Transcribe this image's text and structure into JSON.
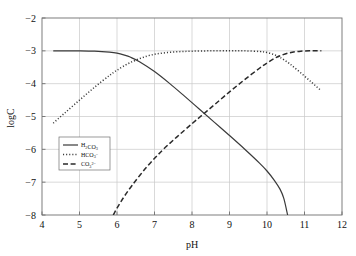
{
  "chart_data": {
    "type": "line",
    "title": "",
    "xlabel": "pH",
    "ylabel": "logC",
    "xlim": [
      4,
      12
    ],
    "ylim": [
      -8,
      -2
    ],
    "grid": true,
    "legend_position": "center-left",
    "xticks": [
      "4",
      "5",
      "6",
      "7",
      "8",
      "9",
      "10",
      "11",
      "12"
    ],
    "xtick_values": [
      4,
      5,
      6,
      7,
      8,
      9,
      10,
      11,
      12
    ],
    "yticks": [
      "−2",
      "−3",
      "−4",
      "−5",
      "−6",
      "−7",
      "−8"
    ],
    "ytick_values": [
      -2,
      -3,
      -4,
      -5,
      -6,
      -7,
      -8
    ],
    "series": [
      {
        "name": "H2CO3",
        "label_main": "H",
        "label_sub1": "2",
        "label_main2": "CO",
        "label_sub2": "3",
        "style": "solid",
        "color": "#3a3a3a",
        "x": [
          4.3,
          4.6,
          5.0,
          5.4,
          5.8,
          6.0,
          6.2,
          6.35,
          6.6,
          7.0,
          7.4,
          7.8,
          8.2,
          8.6,
          9.0,
          9.4,
          9.8,
          10.0,
          10.2,
          10.35,
          10.45,
          10.55
        ],
        "y": [
          -3.0,
          -3.0,
          -3.0,
          -3.01,
          -3.04,
          -3.07,
          -3.13,
          -3.19,
          -3.33,
          -3.63,
          -3.99,
          -4.38,
          -4.78,
          -5.18,
          -5.58,
          -5.99,
          -6.42,
          -6.66,
          -6.95,
          -7.22,
          -7.5,
          -8.0
        ]
      },
      {
        "name": "HCO3-",
        "label_main": "HCO",
        "label_sub1": "3",
        "label_sup": "−",
        "style": "dotted",
        "color": "#3a3a3a",
        "x": [
          4.3,
          4.6,
          5.0,
          5.4,
          5.8,
          6.0,
          6.35,
          6.8,
          7.2,
          7.6,
          8.0,
          8.5,
          9.0,
          9.4,
          9.8,
          10.0,
          10.2,
          10.35,
          10.6,
          10.9,
          11.2,
          11.45
        ],
        "y": [
          -5.2,
          -4.9,
          -4.5,
          -4.11,
          -3.75,
          -3.59,
          -3.36,
          -3.16,
          -3.07,
          -3.03,
          -3.01,
          -3.0,
          -3.0,
          -3.0,
          -3.02,
          -3.05,
          -3.12,
          -3.2,
          -3.39,
          -3.67,
          -3.97,
          -4.22
        ]
      },
      {
        "name": "CO3 2-",
        "label_main": "CO",
        "label_sub1": "3",
        "label_sup": "2−",
        "style": "dashed",
        "color": "#2a2a2a",
        "x": [
          5.9,
          6.1,
          6.4,
          6.8,
          7.2,
          7.6,
          8.0,
          8.3,
          8.6,
          9.0,
          9.4,
          9.8,
          10.0,
          10.2,
          10.35,
          10.6,
          10.9,
          11.2,
          11.45
        ],
        "y": [
          -8.0,
          -7.6,
          -7.1,
          -6.53,
          -6.04,
          -5.62,
          -5.22,
          -4.93,
          -4.64,
          -4.25,
          -3.88,
          -3.53,
          -3.37,
          -3.23,
          -3.15,
          -3.06,
          -3.01,
          -3.0,
          -3.0
        ]
      }
    ],
    "colors": {
      "grid": "#c9c9c9",
      "axis": "#6f6f6f",
      "text": "#111111",
      "background": "#ffffff"
    }
  }
}
